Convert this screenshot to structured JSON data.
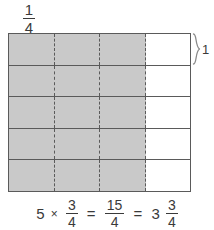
{
  "figure": {
    "type": "fraction-area-model",
    "unit_label": {
      "numerator": "1",
      "denominator": "4"
    },
    "row_bracket": {
      "label": "1",
      "spans_rows": 1
    },
    "grid": {
      "rows": 5,
      "columns": 4,
      "shaded_columns_per_row": 3,
      "shaded_color": "#c9c9c9",
      "unshaded_color": "#ffffff",
      "border_color": "#5a5a5a",
      "cells": [
        [
          "shaded",
          "shaded",
          "shaded",
          "unshaded"
        ],
        [
          "shaded",
          "shaded",
          "shaded",
          "unshaded"
        ],
        [
          "shaded",
          "shaded",
          "shaded",
          "unshaded"
        ],
        [
          "shaded",
          "shaded",
          "shaded",
          "unshaded"
        ],
        [
          "shaded",
          "shaded",
          "shaded",
          "unshaded"
        ]
      ]
    },
    "equation": {
      "multiplier": "5",
      "times_symbol": "×",
      "factor": {
        "numerator": "3",
        "denominator": "4"
      },
      "equals_symbol_1": "=",
      "product": {
        "numerator": "15",
        "denominator": "4"
      },
      "equals_symbol_2": "=",
      "mixed_whole": "3",
      "mixed_fraction": {
        "numerator": "3",
        "denominator": "4"
      }
    }
  }
}
